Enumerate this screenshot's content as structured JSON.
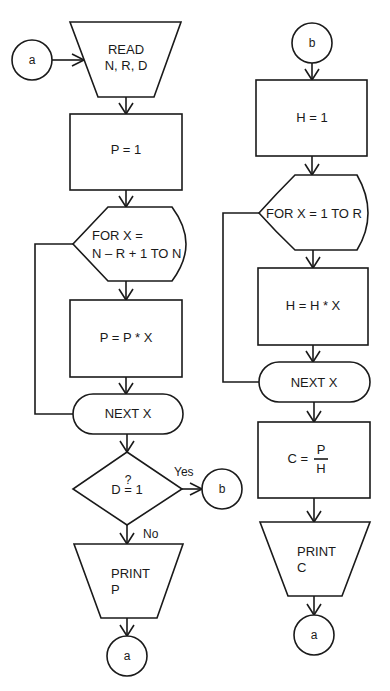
{
  "diagram": {
    "type": "flowchart",
    "left_column": {
      "entry_connector": "a",
      "read_box": {
        "line1": "READ",
        "line2": "N, R, D"
      },
      "init_box": "P = 1",
      "loop_start": {
        "line1": "FOR X =",
        "line2": "N – R + 1 TO N"
      },
      "loop_body": "P = P * X",
      "loop_end": "NEXT X",
      "decision": {
        "top": "?",
        "text": "D = 1",
        "yes_label": "Yes",
        "no_label": "No"
      },
      "yes_connector": "b",
      "print_box": {
        "line1": "PRINT",
        "line2": "P"
      },
      "exit_connector": "a"
    },
    "right_column": {
      "entry_connector": "b",
      "init_box": "H = 1",
      "loop_start": "FOR X = 1 TO R",
      "loop_body": "H = H * X",
      "loop_end": "NEXT X",
      "compute_box": {
        "lhs": "C =",
        "numerator": "P",
        "denominator": "H"
      },
      "print_box": {
        "line1": "PRINT",
        "line2": "C"
      },
      "exit_connector": "a"
    }
  }
}
